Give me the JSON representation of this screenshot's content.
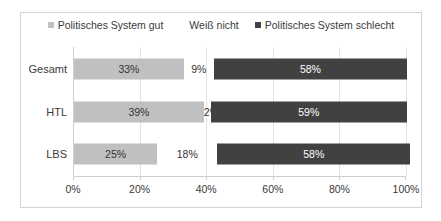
{
  "chart_data": {
    "type": "bar",
    "orientation": "horizontal",
    "stacked": true,
    "stacked_percent": true,
    "title": "",
    "subtitle": "",
    "xlabel": "",
    "ylabel": "",
    "xlim": [
      0,
      100
    ],
    "grid": true,
    "legend_position": "top",
    "categories": [
      "Gesamt",
      "HTL",
      "LBS"
    ],
    "tick_labels": [
      "0%",
      "20%",
      "40%",
      "60%",
      "80%",
      "100%"
    ],
    "tick_values": [
      0,
      20,
      40,
      60,
      80,
      100
    ],
    "series": [
      {
        "name": "Politisches System gut",
        "color": "#c0c0c0",
        "values": [
          33,
          39,
          25
        ],
        "value_labels": [
          "33%",
          "39%",
          "25%"
        ]
      },
      {
        "name": "Weiß nicht",
        "color": "#ffffff",
        "values": [
          9,
          2,
          18
        ],
        "value_labels": [
          "9%",
          "2%",
          "18%"
        ]
      },
      {
        "name": "Politisches System schlecht",
        "color": "#414141",
        "values": [
          58,
          59,
          58
        ],
        "value_labels": [
          "58%",
          "59%",
          "58%"
        ]
      }
    ]
  },
  "legend": {
    "items": [
      {
        "label": "Politisches System gut",
        "swatch": "#c0c0c0",
        "swatch_kind": "filled"
      },
      {
        "label": "Weiß nicht",
        "swatch": "#ffffff",
        "swatch_kind": "empty"
      },
      {
        "label": "Politisches System schlecht",
        "swatch": "#414141",
        "swatch_kind": "filled"
      }
    ]
  },
  "colors": {
    "frame_border": "#d4d4d4",
    "gridline": "#e2e2e2",
    "axis_line": "#cfcfcf",
    "text": "#3a3a3a",
    "label_on_light": "#333333",
    "label_on_dark": "#ffffff",
    "background": "#ffffff"
  }
}
